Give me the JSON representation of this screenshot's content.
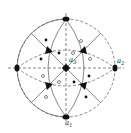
{
  "diagram": {
    "type": "stereographic-projection",
    "center": [
      66,
      68
    ],
    "radius": 49,
    "colors": {
      "line": "#555555",
      "symbol": "#111111",
      "background": "#ffffff"
    },
    "axes_labels": {
      "a1": {
        "text": "a",
        "sub": "1"
      },
      "a2": {
        "text": "a",
        "sub": "2"
      },
      "a3": {
        "text": "a",
        "sub": "3"
      }
    },
    "fourfold_axes": [
      [
        66,
        68
      ],
      [
        66,
        19
      ],
      [
        66,
        117
      ],
      [
        17,
        68
      ],
      [
        115,
        68
      ]
    ],
    "threefold_axes": [
      [
        49,
        51
      ],
      [
        83,
        51
      ],
      [
        49,
        85
      ],
      [
        83,
        85
      ]
    ],
    "filled_poles": [
      [
        46,
        40
      ],
      [
        59,
        53
      ],
      [
        41,
        59
      ],
      [
        89,
        76
      ],
      [
        74,
        82
      ],
      [
        86,
        97
      ]
    ],
    "open_poles": [
      [
        81,
        41
      ],
      [
        73,
        53
      ],
      [
        90,
        59
      ],
      [
        43,
        76
      ],
      [
        59,
        82
      ],
      [
        46,
        97
      ]
    ]
  }
}
